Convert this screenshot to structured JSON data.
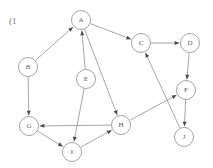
{
  "figure": {
    "label": "(1",
    "label_x": 9,
    "label_y": 16
  },
  "graph": {
    "type": "directed-graph",
    "node_radius": 9.5,
    "node_stroke_color": "#8d8d8d",
    "edge_stroke_color": "#8a8a8a",
    "label_color": "#5d5d5d",
    "background_color": "#fefefe",
    "nodes": [
      {
        "id": "A",
        "label": "A",
        "x": 81,
        "y": 20
      },
      {
        "id": "B",
        "label": "B",
        "x": 28,
        "y": 67
      },
      {
        "id": "C",
        "label": "C",
        "x": 141,
        "y": 43
      },
      {
        "id": "D",
        "label": "D",
        "x": 190,
        "y": 43
      },
      {
        "id": "E",
        "label": "E",
        "x": 86,
        "y": 79
      },
      {
        "id": "F",
        "label": "F",
        "x": 186,
        "y": 90
      },
      {
        "id": "G",
        "label": "G",
        "x": 29,
        "y": 126
      },
      {
        "id": "H",
        "label": "H",
        "x": 121,
        "y": 125
      },
      {
        "id": "I",
        "label": "I",
        "x": 72,
        "y": 152
      },
      {
        "id": "J",
        "label": "J",
        "x": 184,
        "y": 137
      }
    ],
    "edges": [
      {
        "from": "B",
        "to": "A"
      },
      {
        "from": "E",
        "to": "A"
      },
      {
        "from": "A",
        "to": "C"
      },
      {
        "from": "A",
        "to": "H"
      },
      {
        "from": "E",
        "to": "I"
      },
      {
        "from": "B",
        "to": "G"
      },
      {
        "from": "G",
        "to": "I"
      },
      {
        "from": "I",
        "to": "H"
      },
      {
        "from": "H",
        "to": "G"
      },
      {
        "from": "H",
        "to": "F"
      },
      {
        "from": "C",
        "to": "D"
      },
      {
        "from": "D",
        "to": "F"
      },
      {
        "from": "F",
        "to": "J"
      },
      {
        "from": "J",
        "to": "C"
      }
    ]
  }
}
